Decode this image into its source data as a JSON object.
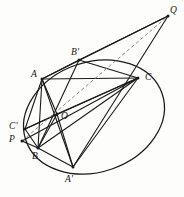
{
  "figure": {
    "stroke_color": "#1a1a1a",
    "dashed_color": "#8a8a8a",
    "background_color": "#fdfdfc",
    "conic": {
      "name": "ellipse",
      "center_x": 94,
      "center_y": 117,
      "radius_x": 72,
      "radius_y": 55,
      "rotation_deg": -19
    },
    "points": [
      {
        "id": "Q",
        "label": "Q",
        "x": 168,
        "y": 16,
        "label_x": 170,
        "label_y": 6,
        "on_conic": false
      },
      {
        "id": "Bp",
        "label": "B'",
        "x": 79,
        "y": 60,
        "label_x": 71,
        "label_y": 48,
        "on_conic": true
      },
      {
        "id": "A",
        "label": "A",
        "x": 42,
        "y": 79,
        "label_x": 31,
        "label_y": 70,
        "on_conic": true
      },
      {
        "id": "C",
        "label": "C",
        "x": 138,
        "y": 78,
        "label_x": 145,
        "label_y": 73,
        "on_conic": true
      },
      {
        "id": "O",
        "label": "O",
        "x": 57,
        "y": 114,
        "label_x": 61,
        "label_y": 112,
        "on_conic": false
      },
      {
        "id": "Cp",
        "label": "C'",
        "x": 25,
        "y": 129,
        "label_x": 9,
        "label_y": 122,
        "on_conic": true
      },
      {
        "id": "P",
        "label": "P",
        "x": 22,
        "y": 141,
        "label_x": 9,
        "label_y": 135,
        "on_conic": false
      },
      {
        "id": "B",
        "label": "B",
        "x": 38,
        "y": 148,
        "label_x": 32,
        "label_y": 152,
        "on_conic": true
      },
      {
        "id": "Ap",
        "label": "A'",
        "x": 73,
        "y": 167,
        "label_x": 65,
        "label_y": 175,
        "on_conic": true
      }
    ],
    "solid_segments": [
      {
        "name": "segment-A-C",
        "from": "A",
        "to": "C"
      },
      {
        "name": "segment-A-B",
        "from": "A",
        "to": "B"
      },
      {
        "name": "segment-A-O",
        "from": "A",
        "to": "O"
      },
      {
        "name": "segment-A-Ap",
        "from": "A",
        "to": "Ap"
      },
      {
        "name": "segment-A-Bp",
        "from": "A",
        "to": "Bp"
      },
      {
        "name": "segment-A-Cp",
        "from": "A",
        "to": "Cp"
      },
      {
        "name": "segment-A-Q",
        "from": "A",
        "to": "Q"
      },
      {
        "name": "segment-Bp-B",
        "from": "Bp",
        "to": "B"
      },
      {
        "name": "segment-Bp-C",
        "from": "Bp",
        "to": "C"
      },
      {
        "name": "segment-Bp-Q",
        "from": "Bp",
        "to": "Q"
      },
      {
        "name": "segment-C-B",
        "from": "C",
        "to": "B"
      },
      {
        "name": "segment-C-O",
        "from": "C",
        "to": "O"
      },
      {
        "name": "segment-C-Ap",
        "from": "C",
        "to": "Ap"
      },
      {
        "name": "segment-C-Cp",
        "from": "C",
        "to": "Cp"
      },
      {
        "name": "segment-C-P",
        "from": "C",
        "to": "P"
      },
      {
        "name": "segment-O-B",
        "from": "O",
        "to": "B"
      },
      {
        "name": "segment-O-Ap",
        "from": "O",
        "to": "Ap"
      },
      {
        "name": "segment-O-Cp",
        "from": "O",
        "to": "Cp"
      },
      {
        "name": "segment-B-Ap",
        "from": "B",
        "to": "Ap"
      },
      {
        "name": "segment-P-B",
        "from": "P",
        "to": "B"
      },
      {
        "name": "segment-Cp-B",
        "from": "Cp",
        "to": "B"
      },
      {
        "name": "segment-Ap-Q",
        "from": "Ap",
        "to": "Q"
      }
    ],
    "dashed_segments": [
      {
        "name": "dashed-line-P-O-Q",
        "from": "P",
        "to": "Q"
      }
    ]
  }
}
